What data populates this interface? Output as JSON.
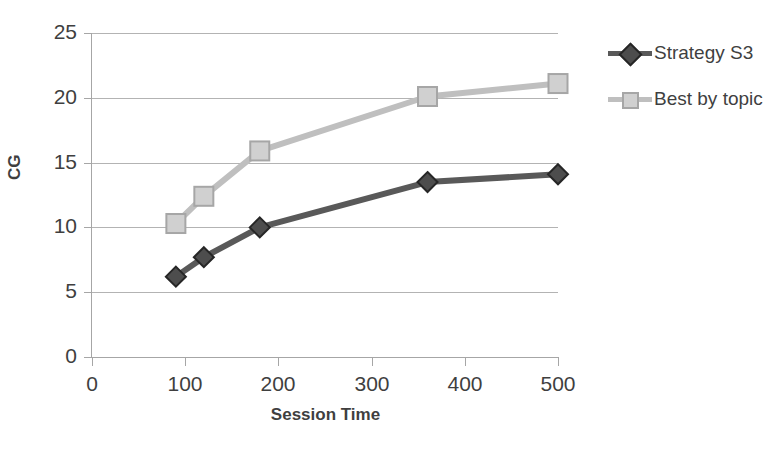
{
  "chart_data": {
    "type": "line",
    "title": "",
    "xlabel": "Session Time",
    "ylabel": "CG",
    "xlim": [
      0,
      500
    ],
    "ylim": [
      0,
      25
    ],
    "xticks": [
      0,
      100,
      200,
      300,
      400,
      500
    ],
    "yticks": [
      0,
      5,
      10,
      15,
      20,
      25
    ],
    "grid": true,
    "legend_position": "right",
    "series": [
      {
        "name": "Strategy S3",
        "color": "#595959",
        "marker": "diamond",
        "x": [
          90,
          120,
          180,
          360,
          500
        ],
        "y": [
          6.2,
          7.7,
          10.0,
          13.5,
          14.1
        ]
      },
      {
        "name": "Best by topic",
        "color": "#bfbfbf",
        "marker": "square",
        "x": [
          90,
          120,
          180,
          360,
          500
        ],
        "y": [
          10.3,
          12.4,
          15.9,
          20.1,
          21.1
        ]
      }
    ]
  },
  "axes": {
    "y_tick_labels": [
      "25",
      "20",
      "15",
      "10",
      "5",
      "0"
    ],
    "x_tick_labels": [
      "0",
      "100",
      "200",
      "300",
      "400",
      "500"
    ],
    "y_title": "CG",
    "x_title": "Session Time"
  },
  "legend": {
    "items": [
      {
        "label": "Strategy S3",
        "color": "#595959",
        "marker": "diamond"
      },
      {
        "label": "Best by topic",
        "color": "#bfbfbf",
        "marker": "square"
      }
    ]
  },
  "colors": {
    "series_dark": "#595959",
    "series_light": "#bfbfbf",
    "grid": "#b3b3b3",
    "axis": "#a6a6a6",
    "text": "#3f3f3f",
    "background": "#ffffff"
  }
}
